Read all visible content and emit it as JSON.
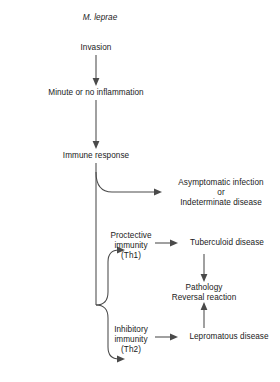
{
  "diagram": {
    "type": "flowchart",
    "nodes": {
      "organism": {
        "label": "M. leprae"
      },
      "invasion": {
        "label": "Invasion"
      },
      "inflammation": {
        "label": "Minute or no inflammation"
      },
      "immune_response": {
        "label": "Immune response"
      },
      "asymptomatic": {
        "line1": "Asymptomatic infection",
        "line2": "or",
        "line3": "Indeterminate disease"
      },
      "protective": {
        "line1": "Proctective",
        "line2": "immunity",
        "line3": "(Th1)"
      },
      "inhibitory": {
        "line1": "Inhibitory",
        "line2": "immunity",
        "line3": "(Th2)"
      },
      "tuberculoid": {
        "label": "Tuberculoid disease"
      },
      "lepromatous": {
        "label": "Lepromatous disease"
      },
      "pathology": {
        "line1": "Pathology",
        "line2": "Reversal reaction"
      }
    },
    "colors": {
      "stroke": "#4a4a4a",
      "text": "#1a1a1a",
      "background": "#ffffff"
    }
  }
}
